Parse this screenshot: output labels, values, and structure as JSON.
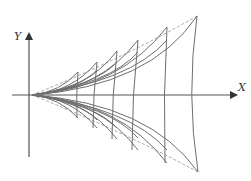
{
  "axes": {
    "x_label": "X",
    "y_label": "Y"
  },
  "colors": {
    "curve": "#6e6e6e",
    "axis": "#555555",
    "envelope": "#9a9a9a"
  },
  "diagram": {
    "origin": [
      32,
      95
    ],
    "cusps_upper": [
      [
        78,
        72
      ],
      [
        97,
        62
      ],
      [
        117,
        51
      ],
      [
        138,
        40
      ],
      [
        167,
        27
      ],
      [
        197,
        16
      ]
    ],
    "cusps_lower": [
      [
        78,
        118
      ],
      [
        97,
        128
      ],
      [
        117,
        139
      ],
      [
        138,
        150
      ],
      [
        167,
        163
      ],
      [
        198,
        172
      ]
    ]
  }
}
